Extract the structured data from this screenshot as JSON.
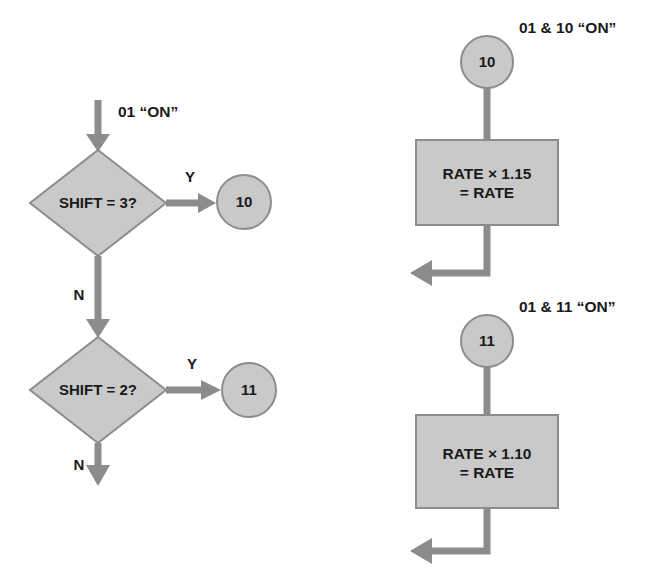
{
  "diagram": {
    "type": "flowchart",
    "background_color": "#ffffff",
    "shape_fill_color": "#c9c9c9",
    "shape_stroke_color": "#8c8c8c",
    "connector_color": "#8c8c8c",
    "text_color": "#1a1a1a"
  },
  "left_branch": {
    "entry_label": "01 “ON”",
    "decision_1": {
      "text": "SHIFT = 3?",
      "yes_label": "Y",
      "no_label": "N",
      "yes_target": "10"
    },
    "decision_2": {
      "text": "SHIFT = 2?",
      "yes_label": "Y",
      "no_label": "N",
      "yes_target": "11"
    },
    "connector_10": "10",
    "connector_11": "11"
  },
  "right_branch": {
    "block_a": {
      "caption": "01 & 10 “ON”",
      "connector": "10",
      "process_line_1": "RATE × 1.15",
      "process_line_2": "= RATE"
    },
    "block_b": {
      "caption": "01 & 11 “ON”",
      "connector": "11",
      "process_line_1": "RATE × 1.10",
      "process_line_2": "= RATE"
    }
  }
}
